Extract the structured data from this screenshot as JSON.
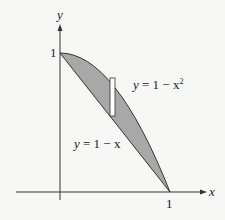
{
  "figure": {
    "type": "area-between-curves",
    "axes": {
      "x_label": "x",
      "y_label": "y",
      "x_tick": "1",
      "y_tick": "1"
    },
    "curves": [
      {
        "name": "upper",
        "equation_lhs": "y",
        "equation_rhs": "= 1 − x",
        "exponent": "2",
        "full": "y = 1 − x²"
      },
      {
        "name": "lower",
        "equation_lhs": "y",
        "equation_rhs": "= 1 − x",
        "full": "y = 1 − x"
      }
    ],
    "region": {
      "fill": "#a8a8a8",
      "between": "y = 1 − x and y = 1 − x²",
      "x_range": [
        0,
        1
      ]
    },
    "strip": {
      "fill": "#ffffff",
      "description": "representative vertical rectangle"
    },
    "colors": {
      "axis": "#333333",
      "curve": "#333333",
      "background": "#f7f7f5"
    }
  }
}
